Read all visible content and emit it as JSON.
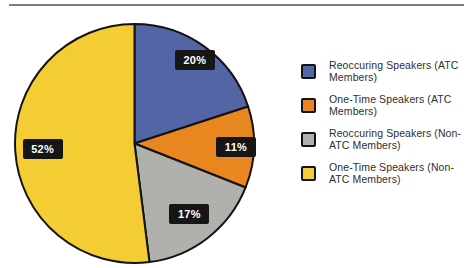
{
  "page": {
    "background": "#ffffff",
    "rule_color": "#7d7d7d"
  },
  "chart_data": {
    "type": "pie",
    "title": "",
    "direction": "clockwise",
    "start_angle": "12-o'clock",
    "outline_color": "#131313",
    "legend_position": "right",
    "data_label_style": {
      "bg": "#161616",
      "text_color": "#ffffff"
    },
    "slices": [
      {
        "label": "Reoccuring Speakers (ATC Members)",
        "value": 20,
        "pct_label": "20%",
        "color": "#5365A4"
      },
      {
        "label": "One-Time Speakers (ATC Members)",
        "value": 11,
        "pct_label": "11%",
        "color": "#E8861F"
      },
      {
        "label": "Reoccuring Speakers (Non-ATC Members)",
        "value": 17,
        "pct_label": "17%",
        "color": "#B0B0AC"
      },
      {
        "label": "One-Time Speakers (Non-ATC Members)",
        "value": 52,
        "pct_label": "52%",
        "color": "#F4CC33"
      }
    ]
  }
}
